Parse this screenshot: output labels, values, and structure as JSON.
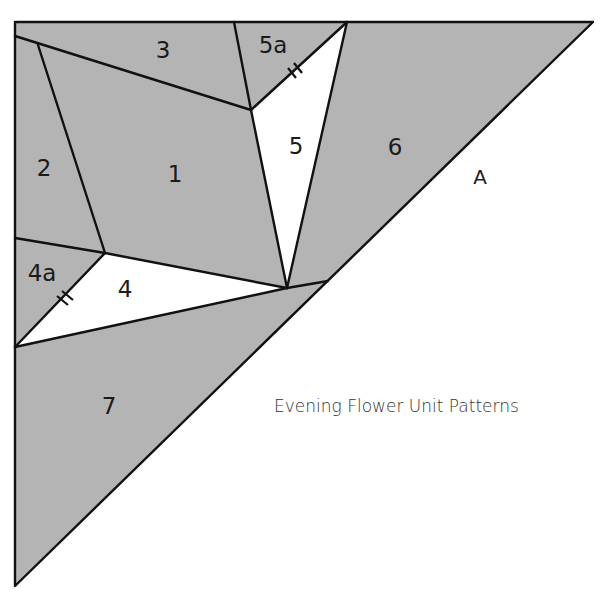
{
  "title": "Evening Flower Unit Patterns",
  "unit_label": "A",
  "colors": {
    "fill_gray": "#b4b4b4",
    "fill_white": "#ffffff",
    "line": "#111111"
  },
  "pieces": [
    {
      "id": "1",
      "label": "1",
      "fill": "gray"
    },
    {
      "id": "2",
      "label": "2",
      "fill": "gray"
    },
    {
      "id": "3",
      "label": "3",
      "fill": "gray"
    },
    {
      "id": "4",
      "label": "4",
      "fill": "white"
    },
    {
      "id": "4a",
      "label": "4a",
      "fill": "gray"
    },
    {
      "id": "5",
      "label": "5",
      "fill": "white"
    },
    {
      "id": "5a",
      "label": "5a",
      "fill": "gray"
    },
    {
      "id": "6",
      "label": "6",
      "fill": "gray"
    },
    {
      "id": "7",
      "label": "7",
      "fill": "gray"
    }
  ],
  "match_marks": [
    "4a-4 seam",
    "5a-5 seam"
  ]
}
